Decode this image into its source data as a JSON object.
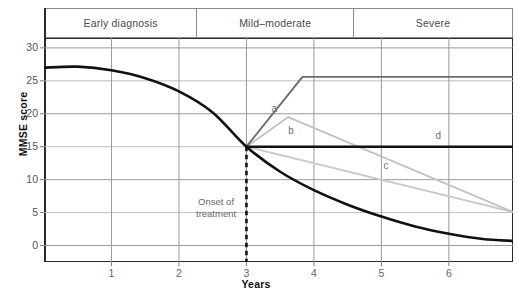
{
  "chart_data": {
    "type": "line",
    "title": "",
    "xlabel": "Years",
    "ylabel": "MMSE score",
    "xlim": [
      0,
      6.95
    ],
    "ylim": [
      -2.5,
      31.5
    ],
    "grid": true,
    "legend_position": "inline-annotations",
    "y_ticks": [
      0,
      5,
      10,
      15,
      20,
      25,
      30
    ],
    "x_ticks": [
      1,
      2,
      3,
      4,
      5,
      6
    ],
    "stage_bands": [
      {
        "label": "Early diagnosis",
        "x_start": 0.0,
        "x_end": 2.27
      },
      {
        "label": "Mild–moderate",
        "x_start": 2.27,
        "x_end": 4.6
      },
      {
        "label": "Severe",
        "x_start": 4.6,
        "x_end": 6.95
      }
    ],
    "annotations": [
      {
        "text": "Onset of",
        "x": 2.55,
        "y": 6.4
      },
      {
        "text": "treatment",
        "x": 2.55,
        "y": 4.7
      },
      {
        "text": "a",
        "x": 3.37,
        "y": 20.6
      },
      {
        "text": "b",
        "x": 3.62,
        "y": 17.2
      },
      {
        "text": "c",
        "x": 5.03,
        "y": 11.9
      },
      {
        "text": "d",
        "x": 5.8,
        "y": 16.4
      }
    ],
    "markers": [
      {
        "name": "onset-of-treatment",
        "type": "vertical-dashed",
        "x": 3,
        "y_top": 15,
        "y_bottom": -2.5,
        "color": "#111111"
      }
    ],
    "series": [
      {
        "name": "untreated-decline",
        "id": "untreated",
        "color": "#111111",
        "width": 2.6,
        "style": "solid",
        "points": [
          [
            0,
            27.0
          ],
          [
            0.5,
            27.15
          ],
          [
            1.0,
            26.6
          ],
          [
            1.5,
            25.4
          ],
          [
            2.0,
            23.4
          ],
          [
            2.5,
            20.2
          ],
          [
            3.0,
            15.0
          ],
          [
            3.5,
            11.2
          ],
          [
            4.0,
            8.4
          ],
          [
            4.5,
            6.2
          ],
          [
            5.0,
            4.4
          ],
          [
            5.5,
            2.9
          ],
          [
            6.0,
            1.8
          ],
          [
            6.5,
            1.0
          ],
          [
            6.95,
            0.7
          ]
        ]
      },
      {
        "name": "a",
        "id": "a",
        "color": "#6d6d6d",
        "width": 1.9,
        "style": "solid",
        "points": [
          [
            3.0,
            15.0
          ],
          [
            3.83,
            25.6
          ],
          [
            6.95,
            25.6
          ]
        ]
      },
      {
        "name": "b",
        "id": "b",
        "color": "#c2c2c2",
        "width": 1.9,
        "style": "solid",
        "points": [
          [
            3.0,
            15.0
          ],
          [
            3.62,
            19.5
          ],
          [
            6.95,
            5.1
          ]
        ]
      },
      {
        "name": "c",
        "id": "c",
        "color": "#cacaca",
        "width": 1.9,
        "style": "solid",
        "points": [
          [
            3.0,
            15.0
          ],
          [
            6.95,
            5.1
          ]
        ]
      },
      {
        "name": "d",
        "id": "d",
        "color": "#111111",
        "width": 2.6,
        "style": "solid",
        "points": [
          [
            3.0,
            15.0
          ],
          [
            6.95,
            15.0
          ]
        ]
      }
    ]
  },
  "bands": {
    "early": "Early diagnosis",
    "mild": "Mild–moderate",
    "severe": "Severe"
  },
  "axes": {
    "y_title": "MMSE score",
    "x_title": "Years",
    "y_ticks": [
      "30",
      "25",
      "20",
      "15",
      "10",
      "5",
      "0"
    ],
    "x_ticks": [
      "1",
      "2",
      "3",
      "4",
      "5",
      "6"
    ]
  },
  "labels": {
    "a": "a",
    "b": "b",
    "c": "c",
    "d": "d",
    "onset_line1": "Onset of",
    "onset_line2": "treatment"
  },
  "colors": {
    "untreated": "#111111",
    "curve_a": "#6d6d6d",
    "curve_b": "#c2c2c2",
    "curve_c": "#cacaca",
    "curve_d": "#111111",
    "grid": "#9a9a9a",
    "grid_light": "#b8b8b8",
    "frame": "#2b2b2b",
    "band_border": "#8a8a8a",
    "text": "#4a4a4a"
  }
}
